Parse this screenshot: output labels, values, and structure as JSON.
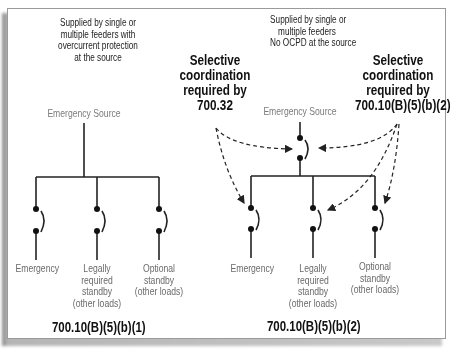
{
  "diagram": {
    "left_panel": {
      "supply_note": [
        "Supplied by single or",
        "multiple feeders with",
        "overcurrent protection",
        "at the source"
      ],
      "source_label": "Emergency Source",
      "loads": [
        {
          "label": [
            "Emergency"
          ]
        },
        {
          "label": [
            "Legally",
            "required",
            "standby",
            "(other loads)"
          ]
        },
        {
          "label": [
            "Optional",
            "standby",
            "(other loads)"
          ]
        }
      ],
      "code_reference": "700.10(B)(5)(b)(1)"
    },
    "right_panel": {
      "supply_note": [
        "Supplied by single or",
        "multiple feeders",
        "No OCPD at the source"
      ],
      "source_label": "Emergency Source",
      "callout_left": [
        "Selective",
        "coordination",
        "required by",
        "700.32"
      ],
      "callout_right": [
        "Selective",
        "coordination",
        "required by",
        "700.10(B)(5)(b)(2)"
      ],
      "loads": [
        {
          "label": [
            "Emergency"
          ]
        },
        {
          "label": [
            "Legally",
            "required",
            "standby",
            "(other loads)"
          ]
        },
        {
          "label": [
            "Optional",
            "standby",
            "(other loads)"
          ]
        }
      ],
      "code_reference": "700.10(B)(5)(b)(2)"
    },
    "colors": {
      "line": "#222222",
      "source_label": "#7a7a7a",
      "load_label": "#6a6a6a",
      "frame_border": "#9a9a9a"
    }
  }
}
